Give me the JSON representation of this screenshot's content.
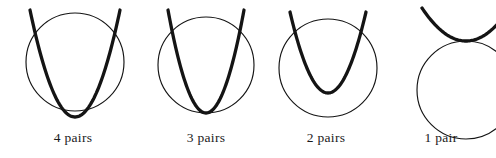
{
  "page": {
    "background_color": "#ffffff",
    "stroke_color": "#141414",
    "width": 496,
    "height": 158
  },
  "style": {
    "circle_stroke_width": 1.15,
    "parabola_stroke_width": 3.3,
    "caption_font_size": 13.5,
    "caption_color": "#1a1a1a"
  },
  "figures": [
    {
      "id": "figure-4-pairs",
      "caption": "4 pairs",
      "intersection_count": 4,
      "caption_y": 130,
      "group_left": 0,
      "group_width": 146,
      "circle": {
        "cx": 75,
        "cy": 62,
        "r": 49
      },
      "parabola": {
        "vertex_x": 75,
        "vertex_y": 117,
        "half_width": 45,
        "top_y": 10,
        "note": "vertex below circle bottom; arms cross circle sides and bottom"
      }
    },
    {
      "id": "figure-3-pairs",
      "caption": "3 pairs",
      "intersection_count": 3,
      "caption_y": 130,
      "group_left": 146,
      "group_width": 120,
      "circle": {
        "cx": 60,
        "cy": 65,
        "r": 48
      },
      "parabola": {
        "vertex_x": 60,
        "vertex_y": 113,
        "half_width": 38,
        "top_y": 10,
        "note": "vertex tangent to circle bottom; arms cross circle sides"
      }
    },
    {
      "id": "figure-2-pairs",
      "caption": "2 pairs",
      "intersection_count": 2,
      "caption_y": 130,
      "group_left": 266,
      "group_width": 120,
      "circle": {
        "cx": 62,
        "cy": 68,
        "r": 49
      },
      "parabola": {
        "vertex_x": 62,
        "vertex_y": 93,
        "half_width": 38,
        "top_y": 12,
        "note": "vertex inside circle; arms cross circle sides only"
      }
    },
    {
      "id": "figure-1-pair",
      "caption": "1 pair",
      "intersection_count": 1,
      "caption_y": 130,
      "group_left": 386,
      "group_width": 110,
      "circle": {
        "cx": 80,
        "cy": 90,
        "r": 49
      },
      "parabola": {
        "vertex_x": 80,
        "vertex_y": 41,
        "half_width": 44,
        "top_y": 8,
        "note": "vertex tangent to circle top; figure clipped by right page edge"
      }
    }
  ]
}
